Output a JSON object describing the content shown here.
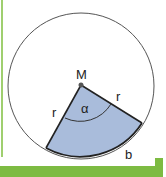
{
  "diagram": {
    "labels": {
      "center": "M",
      "radius_left": "r",
      "radius_right": "r",
      "angle": "α",
      "arc": "b"
    },
    "colors": {
      "sector_fill": "#a9bcdb",
      "stroke": "#222222",
      "circle_stroke": "#555555",
      "accent_green": "#7dbb42",
      "center_dot": "#555555"
    }
  }
}
